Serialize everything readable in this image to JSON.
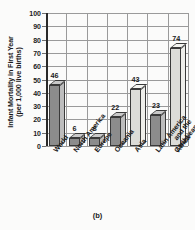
{
  "chart_data": {
    "type": "bar",
    "title": "",
    "subtitle": "",
    "caption": "(b)",
    "xlabel": "",
    "ylabel": "Infant Mortality in First Year (per 1,000 live births)",
    "ylabel_line1": "Infant Mortality in First Year",
    "ylabel_line2": "(per 1,000 live births)",
    "categories": [
      "World",
      "North America",
      "Europe",
      "Oceania",
      "Asia",
      "Latin America and the Caribbean",
      "Africa"
    ],
    "category_lines": [
      [
        "World"
      ],
      [
        "North America"
      ],
      [
        "Europe"
      ],
      [
        "Oceania"
      ],
      [
        "Asia"
      ],
      [
        "Latin America",
        "and the",
        "Caribbean"
      ],
      [
        "Africa"
      ]
    ],
    "values": [
      46,
      6,
      6,
      22,
      43,
      23,
      74
    ],
    "value_labels": [
      "46",
      "6",
      "6",
      "22",
      "43",
      "23",
      "74"
    ],
    "bar_shades": [
      "dark",
      "dark",
      "dark",
      "dark",
      "light",
      "dark",
      "light"
    ],
    "ylim": [
      0,
      100
    ],
    "ytick_values": [
      0,
      10,
      20,
      30,
      40,
      50,
      60,
      70,
      80,
      90,
      100
    ],
    "ytick_labels": [
      "0",
      "10",
      "20",
      "30",
      "40",
      "50",
      "60",
      "70",
      "80",
      "90",
      "100"
    ],
    "grid": true,
    "grid_vertical": true,
    "legend": null,
    "legend_position": "none",
    "colors": {
      "bar_dark_face": "#8c8c8c",
      "bar_dark_side": "#bdbdbd",
      "bar_light_face": "#dcdcd8",
      "bar_light_side": "#efefeb",
      "grid": "#9a9a9a",
      "axis": "#2a2a2a",
      "text": "#1a1a1a",
      "background": "#fbfbfa"
    }
  }
}
